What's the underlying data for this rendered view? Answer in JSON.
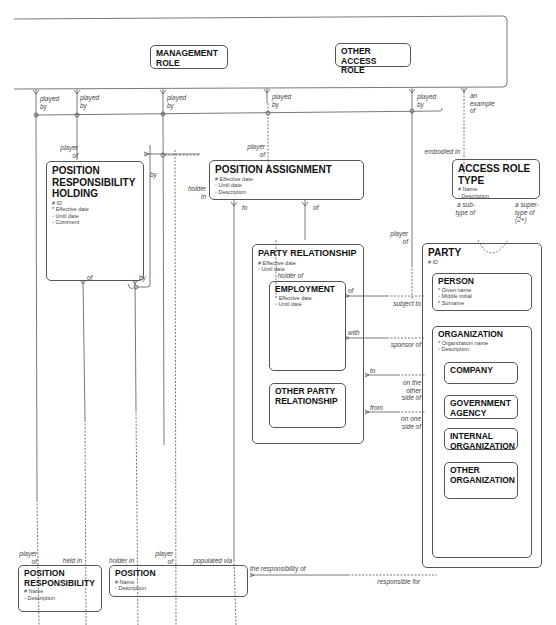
{
  "diagram": {
    "type": "entity-relationship",
    "entities": {
      "access_role_container": {
        "title": ""
      },
      "management_role": {
        "title": "MANAGEMENT ROLE",
        "title_l1": "MANAGEMENT",
        "title_l2": "ROLE"
      },
      "other_access_role": {
        "title": "OTHER ACCESS ROLE",
        "title_l1": "OTHER ACCESS",
        "title_l2": "ROLE"
      },
      "position_responsibility_holding": {
        "title_l1": "POSITION",
        "title_l2": "RESPONSIBILITY",
        "title_l3": "HOLDING",
        "attributes": [
          "# ID",
          "* Effective date",
          "◦ Until date",
          "◦ Comment"
        ]
      },
      "position_assignment": {
        "title": "POSITION ASSIGNMENT",
        "attributes": [
          "# Effective date",
          "◦ Until date",
          "◦ Description"
        ]
      },
      "access_role_type": {
        "title": "ACCESS ROLE TYPE",
        "attributes": [
          "# Name",
          "◦ Description"
        ]
      },
      "party_relationship": {
        "title": "PARTY RELATIONSHIP",
        "attributes": [
          "# Effective date",
          "◦ Until date"
        ]
      },
      "employment": {
        "title": "EMPLOYMENT",
        "attributes": [
          "* Effective date",
          "◦ Until date"
        ]
      },
      "other_party_relationship": {
        "title_l1": "OTHER PARTY",
        "title_l2": "RELATIONSHIP"
      },
      "party": {
        "title": "PARTY",
        "attributes": [
          "# ID"
        ]
      },
      "person": {
        "title": "PERSON",
        "attributes": [
          "* Given name",
          "◦ Middle initial",
          "* Surname"
        ]
      },
      "organization": {
        "title": "ORGANIZATION",
        "attributes": [
          "* Organization name",
          "◦ Description"
        ]
      },
      "company": {
        "title": "COMPANY"
      },
      "government_agency": {
        "title_l1": "GOVERNMENT",
        "title_l2": "AGENCY"
      },
      "internal_organization": {
        "title_l1": "INTERNAL",
        "title_l2": "ORGANIZATION"
      },
      "other_organization": {
        "title_l1": "OTHER",
        "title_l2": "ORGANIZATION"
      },
      "position_responsibility": {
        "title_l1": "POSITION",
        "title_l2": "RESPONSIBILITY",
        "attributes": [
          "# Name",
          "◦ Description"
        ]
      },
      "position": {
        "title": "POSITION",
        "attributes": [
          "# Name",
          "◦ Description"
        ]
      }
    },
    "labels": {
      "played_by": "played",
      "by": "by",
      "an": "an",
      "example": "example",
      "of": "of",
      "player": "player",
      "holder": "holder",
      "in": "in",
      "to": "to",
      "embodied_in": "embodied in",
      "a_sub": "a sub-",
      "type_of": "type of",
      "a_super": "a super-",
      "paren_2plus": "(2+)",
      "holder_of": "holder of",
      "with": "with",
      "from": "from",
      "subject_to": "subject to",
      "sponsor_of": "sponsor of",
      "on_the": "on the",
      "other": "other",
      "side_of": "side of",
      "on_one": "on one",
      "held_in": "held in",
      "holder_in": "holder in",
      "populated_via": "populated via",
      "the_responsibility_of": "the responsibility of",
      "responsible_for": "responsible for"
    },
    "colors": {
      "line": "#555555",
      "text": "#222222",
      "background": "#ffffff"
    }
  }
}
